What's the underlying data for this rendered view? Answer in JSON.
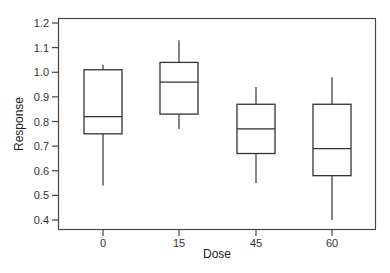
{
  "chart_data": {
    "type": "boxplot",
    "title": "",
    "xlabel": "Dose",
    "ylabel": "Response",
    "categories": [
      "0",
      "15",
      "45",
      "60"
    ],
    "ylim": [
      0.35,
      1.22
    ],
    "yticks": [
      0.4,
      0.5,
      0.6,
      0.7,
      0.8,
      0.9,
      1.0,
      1.1,
      1.2
    ],
    "ytick_labels": [
      "0.4",
      "0.5",
      "0.6",
      "0.7",
      "0.8",
      "0.9",
      "1.0",
      "1.1",
      "1.2"
    ],
    "grid": false,
    "legend": null,
    "series": [
      {
        "category": "0",
        "min": 0.54,
        "q1": 0.75,
        "median": 0.82,
        "q3": 1.01,
        "max": 1.03
      },
      {
        "category": "15",
        "min": 0.77,
        "q1": 0.83,
        "median": 0.96,
        "q3": 1.04,
        "max": 1.13
      },
      {
        "category": "45",
        "min": 0.55,
        "q1": 0.67,
        "median": 0.77,
        "q3": 0.87,
        "max": 0.94
      },
      {
        "category": "60",
        "min": 0.4,
        "q1": 0.58,
        "median": 0.69,
        "q3": 0.87,
        "max": 0.98
      }
    ],
    "colors": {
      "line": "#333333",
      "box_fill": "#ffffff"
    }
  }
}
